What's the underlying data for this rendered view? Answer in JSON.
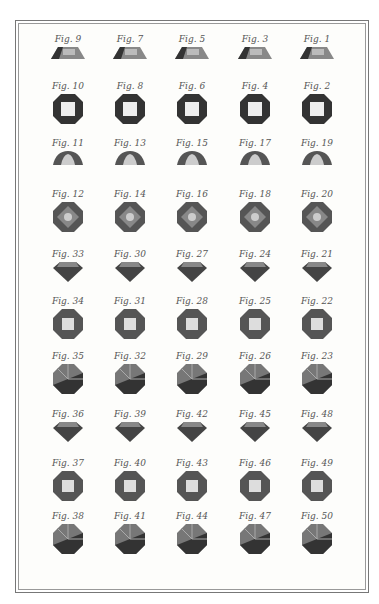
{
  "plate": {
    "rows": [
      {
        "y": 33,
        "shape": "table-profile",
        "figs": [
          "Fig. 9",
          "Fig. 7",
          "Fig. 5",
          "Fig. 3",
          "Fig. 1"
        ]
      },
      {
        "y": 80,
        "shape": "table-top",
        "figs": [
          "Fig. 10",
          "Fig. 8",
          "Fig. 6",
          "Fig. 4",
          "Fig. 2"
        ]
      },
      {
        "y": 137,
        "shape": "rose-profile",
        "figs": [
          "Fig. 11",
          "Fig. 13",
          "Fig. 15",
          "Fig. 17",
          "Fig. 19"
        ]
      },
      {
        "y": 188,
        "shape": "rose-top",
        "figs": [
          "Fig. 12",
          "Fig. 14",
          "Fig. 16",
          "Fig. 18",
          "Fig. 20"
        ]
      },
      {
        "y": 248,
        "shape": "brilliant-profile",
        "figs": [
          "Fig. 33",
          "Fig. 30",
          "Fig. 27",
          "Fig. 24",
          "Fig. 21"
        ]
      },
      {
        "y": 295,
        "shape": "brilliant-top",
        "figs": [
          "Fig. 34",
          "Fig. 31",
          "Fig. 28",
          "Fig. 25",
          "Fig. 22"
        ]
      },
      {
        "y": 350,
        "shape": "brilliant-back",
        "figs": [
          "Fig. 35",
          "Fig. 32",
          "Fig. 29",
          "Fig. 26",
          "Fig. 23"
        ]
      },
      {
        "y": 408,
        "shape": "brilliant-profile",
        "figs": [
          "Fig. 36",
          "Fig. 39",
          "Fig. 42",
          "Fig. 45",
          "Fig. 48"
        ]
      },
      {
        "y": 457,
        "shape": "brilliant-top",
        "figs": [
          "Fig. 37",
          "Fig. 40",
          "Fig. 43",
          "Fig. 46",
          "Fig. 49"
        ]
      },
      {
        "y": 510,
        "shape": "brilliant-back",
        "figs": [
          "Fig. 38",
          "Fig. 41",
          "Fig. 44",
          "Fig. 47",
          "Fig. 50"
        ]
      }
    ],
    "columns_x": [
      38,
      100,
      162,
      225,
      287
    ]
  }
}
